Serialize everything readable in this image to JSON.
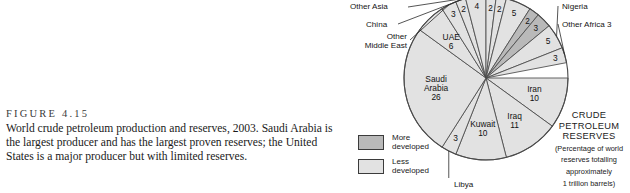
{
  "figure": {
    "number": "FIGURE 4.15",
    "caption": "World crude petroleum production and reserves, 2003. Saudi Arabia is the largest producer and has the largest proven reserves; the United States is a major producer but with limited reserves."
  },
  "legend": {
    "items": [
      {
        "label": "More\ndeveloped",
        "color": "#b9b9b9",
        "border": "#3b3b3b"
      },
      {
        "label": "Less\ndeveloped",
        "color": "#e2e2e2",
        "border": "#3b3b3b"
      }
    ]
  },
  "title_block": {
    "line1": "CRUDE",
    "line2": "PETROLEUM",
    "line3": "RESERVES",
    "sub1": "(Percentage of world",
    "sub2": "reserves totalling",
    "sub3": "approximately",
    "sub4": "1 trillion barrels)"
  },
  "outer_labels": {
    "other_asia": "Other Asia",
    "china": "China",
    "other_middle_east": "Other\nMiddle East",
    "nigeria": "Nigeria",
    "other_africa": "Other Africa 3",
    "libya": "Libya"
  },
  "chart_data": {
    "type": "pie",
    "title": "CRUDE PETROLEUM RESERVES",
    "subtitle": "(Percentage of world reserves totalling approximately 1 trillion barrels)",
    "unit": "percent of world reserves",
    "total": 100,
    "legend_position": "bottom-left",
    "start_angle_deg": 0,
    "direction": "clockwise",
    "categories": [
      "Iran",
      "Iraq",
      "Kuwait",
      "Libya",
      "Saudi Arabia",
      "UAE",
      "Other Middle East",
      "China",
      "Other Asia",
      "Unlabeled A",
      "Unlabeled B",
      "Unlabeled C",
      "Unlabeled D",
      "Unlabeled E",
      "Nigeria",
      "Other Africa"
    ],
    "slices": [
      {
        "label": "Iran",
        "value": 10,
        "inner_text": "Iran\n10",
        "group": "less",
        "placement": "inner"
      },
      {
        "label": "Iraq",
        "value": 11,
        "inner_text": "Iraq\n11",
        "group": "less",
        "placement": "inner"
      },
      {
        "label": "Kuwait",
        "value": 10,
        "inner_text": "Kuwait\n10",
        "group": "less",
        "placement": "inner"
      },
      {
        "label": "Libya",
        "value": 3,
        "inner_text": "3",
        "group": "less",
        "placement": "leader-bottom"
      },
      {
        "label": "Saudi Arabia",
        "value": 26,
        "inner_text": "Saudi\nArabia\n26",
        "group": "less",
        "placement": "inner"
      },
      {
        "label": "UAE",
        "value": 6,
        "inner_text": "UAE\n6",
        "group": "less",
        "placement": "inner"
      },
      {
        "label": "Other Middle East",
        "value": 3,
        "inner_text": "3",
        "group": "less",
        "placement": "leader-left"
      },
      {
        "label": "China",
        "value": 2,
        "inner_text": "2",
        "group": "less",
        "placement": "leader-left"
      },
      {
        "label": "Other Asia",
        "value": 4,
        "inner_text": "4",
        "group": "less",
        "placement": "leader-left"
      },
      {
        "label": "Unlabeled A",
        "value": 2,
        "inner_text": "2",
        "group": "less",
        "placement": "inner-rim"
      },
      {
        "label": "Unlabeled B",
        "value": 2,
        "inner_text": "2",
        "group": "less",
        "placement": "inner-rim"
      },
      {
        "label": "Unlabeled C",
        "value": 5,
        "inner_text": "5",
        "group": "less",
        "placement": "inner-rim"
      },
      {
        "label": "Unlabeled D",
        "value": 2,
        "inner_text": "2",
        "group": "more",
        "placement": "inner-rim"
      },
      {
        "label": "Unlabeled E",
        "value": 3,
        "inner_text": "3",
        "group": "more",
        "placement": "inner-rim"
      },
      {
        "label": "Nigeria",
        "value": 5,
        "inner_text": "5",
        "group": "less",
        "placement": "leader-right"
      },
      {
        "label": "Other Africa",
        "value": 3,
        "inner_text": "3",
        "group": "less",
        "placement": "leader-right"
      }
    ],
    "colors": {
      "more_developed": "#b9b9b9",
      "less_developed": "#e2e2e2",
      "outline": "#4a4a4a"
    }
  }
}
